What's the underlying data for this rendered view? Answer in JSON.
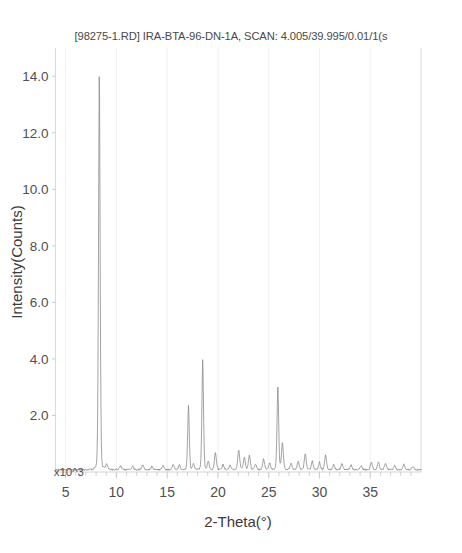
{
  "chart_data": {
    "type": "line",
    "title": "[98275-1.RD] IRA-BTA-96-DN-1A, SCAN: 4.005/39.995/0.01/1(s",
    "xlabel": "2-Theta(°)",
    "ylabel": "Intensity(Counts)",
    "y_exponent_label": "x10^3",
    "xlim": [
      4.005,
      39.995
    ],
    "ylim": [
      0,
      15.0
    ],
    "xticks": [
      5,
      10,
      15,
      20,
      25,
      30,
      35
    ],
    "xtick_labels": [
      "5",
      "10",
      "15",
      "20",
      "25",
      "30",
      "35"
    ],
    "x_minor_tick_step": 1,
    "yticks": [
      2.0,
      4.0,
      6.0,
      8.0,
      10.0,
      12.0,
      14.0
    ],
    "ytick_labels": [
      "2.0",
      "4.0",
      "6.0",
      "8.0",
      "10.0",
      "12.0",
      "14.0"
    ],
    "grid": "faint-vertical",
    "legend": "none",
    "y_units": "counts x 10^3",
    "line_color": "#8c8c8c",
    "baseline_counts": 0.08,
    "peaks": [
      {
        "two_theta": 8.32,
        "intensity": 14.05,
        "width": 0.085
      },
      {
        "two_theta": 9.05,
        "intensity": 0.22,
        "width": 0.1
      },
      {
        "two_theta": 10.4,
        "intensity": 0.14,
        "width": 0.1
      },
      {
        "two_theta": 11.6,
        "intensity": 0.12,
        "width": 0.1
      },
      {
        "two_theta": 12.6,
        "intensity": 0.18,
        "width": 0.1
      },
      {
        "two_theta": 13.5,
        "intensity": 0.12,
        "width": 0.1
      },
      {
        "two_theta": 14.6,
        "intensity": 0.14,
        "width": 0.1
      },
      {
        "two_theta": 15.6,
        "intensity": 0.2,
        "width": 0.1
      },
      {
        "two_theta": 16.2,
        "intensity": 0.16,
        "width": 0.1
      },
      {
        "two_theta": 17.1,
        "intensity": 2.28,
        "width": 0.085
      },
      {
        "two_theta": 17.6,
        "intensity": 0.2,
        "width": 0.1
      },
      {
        "two_theta": 18.5,
        "intensity": 3.92,
        "width": 0.085
      },
      {
        "two_theta": 19.05,
        "intensity": 0.3,
        "width": 0.1
      },
      {
        "two_theta": 19.75,
        "intensity": 0.62,
        "width": 0.1
      },
      {
        "two_theta": 20.5,
        "intensity": 0.18,
        "width": 0.1
      },
      {
        "two_theta": 21.2,
        "intensity": 0.16,
        "width": 0.1
      },
      {
        "two_theta": 22.05,
        "intensity": 0.72,
        "width": 0.1
      },
      {
        "two_theta": 22.6,
        "intensity": 0.45,
        "width": 0.1
      },
      {
        "two_theta": 23.1,
        "intensity": 0.52,
        "width": 0.1
      },
      {
        "two_theta": 23.7,
        "intensity": 0.2,
        "width": 0.1
      },
      {
        "two_theta": 24.5,
        "intensity": 0.38,
        "width": 0.1
      },
      {
        "two_theta": 25.1,
        "intensity": 0.24,
        "width": 0.1
      },
      {
        "two_theta": 25.9,
        "intensity": 3.02,
        "width": 0.085
      },
      {
        "two_theta": 26.35,
        "intensity": 0.95,
        "width": 0.1
      },
      {
        "two_theta": 27.2,
        "intensity": 0.22,
        "width": 0.1
      },
      {
        "two_theta": 27.9,
        "intensity": 0.3,
        "width": 0.1
      },
      {
        "two_theta": 28.6,
        "intensity": 0.58,
        "width": 0.1
      },
      {
        "two_theta": 29.3,
        "intensity": 0.3,
        "width": 0.1
      },
      {
        "two_theta": 30.0,
        "intensity": 0.26,
        "width": 0.1
      },
      {
        "two_theta": 30.6,
        "intensity": 0.52,
        "width": 0.1
      },
      {
        "two_theta": 31.4,
        "intensity": 0.18,
        "width": 0.1
      },
      {
        "two_theta": 32.2,
        "intensity": 0.2,
        "width": 0.1
      },
      {
        "two_theta": 33.1,
        "intensity": 0.16,
        "width": 0.1
      },
      {
        "two_theta": 34.1,
        "intensity": 0.14,
        "width": 0.1
      },
      {
        "two_theta": 35.1,
        "intensity": 0.28,
        "width": 0.1
      },
      {
        "two_theta": 35.8,
        "intensity": 0.26,
        "width": 0.1
      },
      {
        "two_theta": 36.5,
        "intensity": 0.24,
        "width": 0.1
      },
      {
        "two_theta": 37.4,
        "intensity": 0.14,
        "width": 0.1
      },
      {
        "two_theta": 38.3,
        "intensity": 0.18,
        "width": 0.1
      },
      {
        "two_theta": 39.2,
        "intensity": 0.12,
        "width": 0.1
      }
    ]
  }
}
